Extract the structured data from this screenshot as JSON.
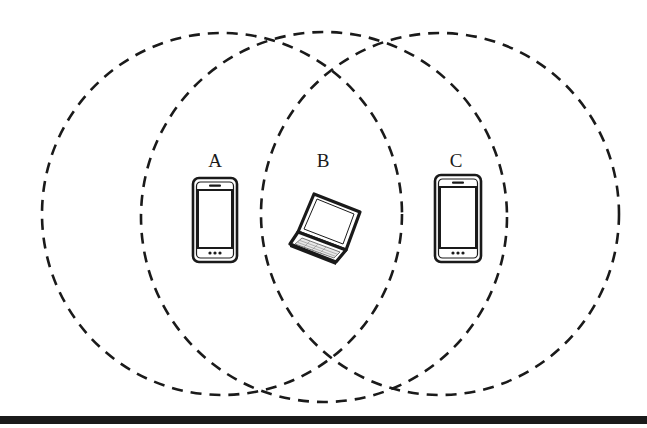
{
  "diagram": {
    "type": "wireless-coverage-overlap",
    "nodes": [
      {
        "id": "A",
        "label": "A",
        "device": "smartphone",
        "icon": "smartphone-icon"
      },
      {
        "id": "B",
        "label": "B",
        "device": "laptop",
        "icon": "laptop-icon"
      },
      {
        "id": "C",
        "label": "C",
        "device": "smartphone",
        "icon": "smartphone-icon"
      }
    ],
    "ranges": [
      {
        "node": "A",
        "style": "dashed-circle"
      },
      {
        "node": "B",
        "style": "dashed-circle"
      },
      {
        "node": "C",
        "style": "dashed-circle"
      }
    ],
    "colors": {
      "stroke": "#1a1a1a",
      "background": "#ffffff"
    }
  }
}
